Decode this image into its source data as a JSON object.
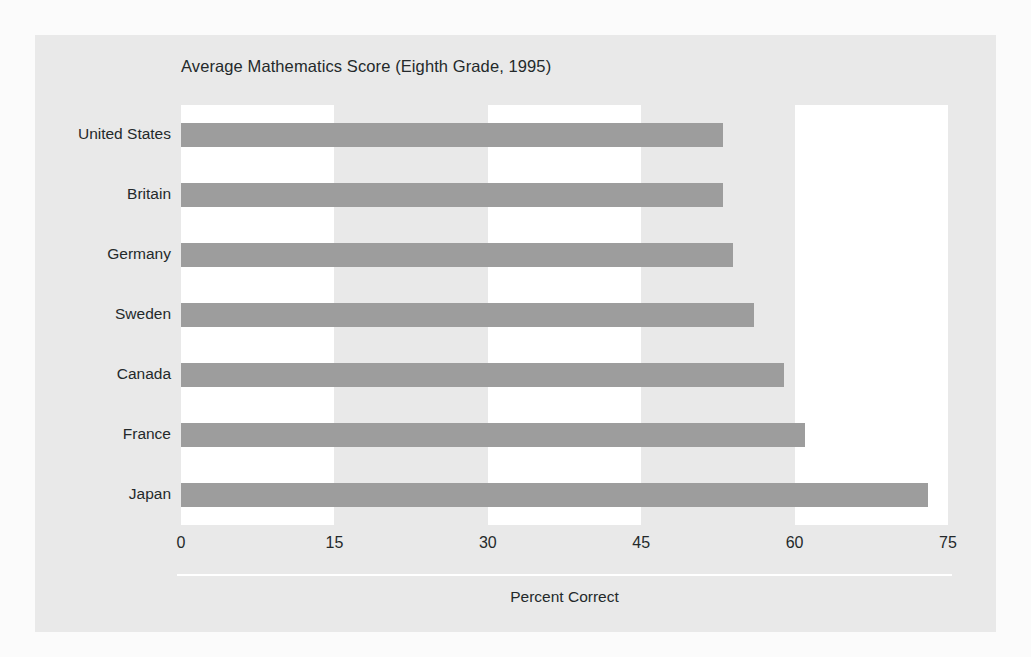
{
  "chart_data": {
    "type": "bar",
    "orientation": "horizontal",
    "title": "Average Mathematics Score (Eighth Grade, 1995)",
    "xlabel": "Percent Correct",
    "ylabel": "",
    "categories": [
      "United States",
      "Britain",
      "Germany",
      "Sweden",
      "Canada",
      "France",
      "Japan"
    ],
    "values": [
      53,
      53,
      54,
      56,
      59,
      61,
      73
    ],
    "xlim": [
      0,
      75
    ],
    "xticks": [
      0,
      15,
      30,
      45,
      60,
      75
    ],
    "xtick_labels": [
      "0",
      "15",
      "30",
      "45",
      "60",
      "75"
    ],
    "grid": false,
    "banded_background": true,
    "band_ranges": [
      [
        0,
        15
      ],
      [
        30,
        45
      ],
      [
        60,
        75
      ]
    ],
    "legend": null,
    "series": [
      {
        "name": "Percent Correct",
        "values": [
          53,
          53,
          54,
          56,
          59,
          61,
          73
        ]
      }
    ]
  },
  "style": {
    "bar_color": "#9d9d9d",
    "panel_color": "#e9e9e9",
    "band_color": "#ffffff",
    "text_color": "#24292b",
    "page_color": "#fbfbfb"
  }
}
